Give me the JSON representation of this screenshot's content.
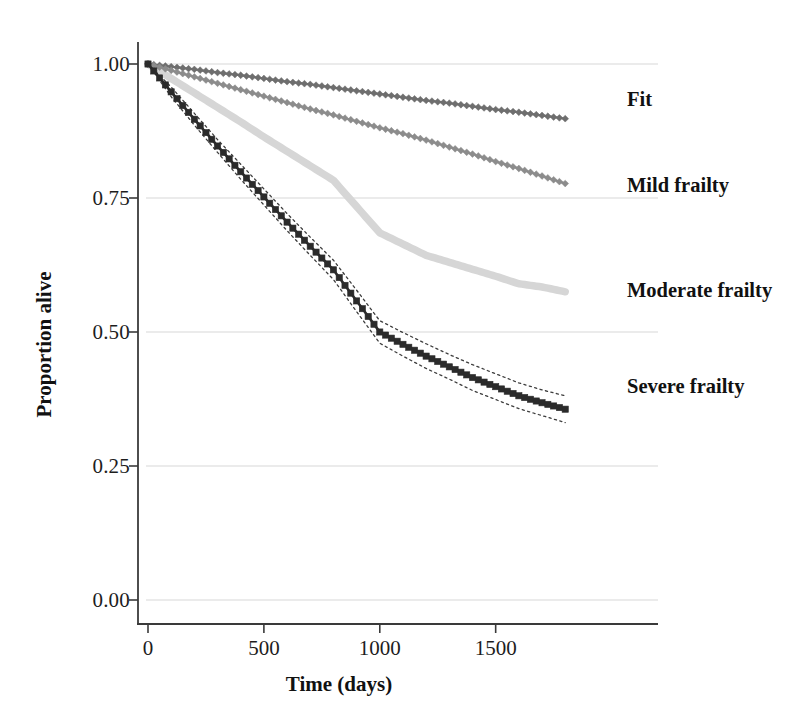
{
  "chart_data": {
    "type": "line",
    "title": "",
    "subtitle": "",
    "xlabel": "Time (days)",
    "ylabel": "Proportion alive",
    "xlim": [
      0,
      1825
    ],
    "ylim": [
      0.0,
      1.0
    ],
    "xticks": [
      0,
      500,
      1000,
      1500
    ],
    "xtick_labels": [
      "0",
      "500",
      "1000",
      "1500"
    ],
    "yticks": [
      0.0,
      0.25,
      0.5,
      0.75,
      1.0
    ],
    "ytick_labels": [
      "0.00",
      "0.25",
      "0.50",
      "0.75",
      "1.00"
    ],
    "grid": "horizontal",
    "legend_position": "right-inline",
    "x": [
      0,
      100,
      200,
      300,
      400,
      500,
      600,
      700,
      800,
      900,
      1000,
      1100,
      1200,
      1300,
      1400,
      1500,
      1600,
      1700,
      1800
    ],
    "series": [
      {
        "name": "Fit",
        "color": "#6e6e6e",
        "marker": "diamond",
        "label_y": 0.935,
        "values": [
          1.0,
          0.995,
          0.99,
          0.984,
          0.979,
          0.973,
          0.967,
          0.962,
          0.956,
          0.95,
          0.944,
          0.938,
          0.932,
          0.927,
          0.921,
          0.915,
          0.91,
          0.904,
          0.898
        ]
      },
      {
        "name": "Mild frailty",
        "color": "#8c8c8c",
        "marker": "diamond",
        "label_y": 0.775,
        "values": [
          1.0,
          0.988,
          0.976,
          0.964,
          0.952,
          0.94,
          0.928,
          0.916,
          0.905,
          0.893,
          0.881,
          0.87,
          0.858,
          0.845,
          0.832,
          0.818,
          0.805,
          0.791,
          0.777
        ]
      },
      {
        "name": "Moderate frailty",
        "color": "#d6d6d6",
        "marker": "none",
        "label_y": 0.578,
        "values": [
          1.0,
          0.973,
          0.946,
          0.919,
          0.892,
          0.864,
          0.837,
          0.81,
          0.783,
          0.734,
          0.685,
          0.664,
          0.643,
          0.63,
          0.617,
          0.604,
          0.59,
          0.584,
          0.575
        ]
      },
      {
        "name": "Severe frailty",
        "color": "#2b2b2b",
        "marker": "square",
        "label_y": 0.4,
        "confidence_band": true,
        "band_style": "dotted",
        "values": [
          1.0,
          0.948,
          0.897,
          0.847,
          0.799,
          0.752,
          0.705,
          0.66,
          0.616,
          0.558,
          0.5,
          0.477,
          0.455,
          0.435,
          0.415,
          0.398,
          0.381,
          0.368,
          0.356
        ],
        "upper": [
          1.0,
          0.957,
          0.908,
          0.859,
          0.813,
          0.767,
          0.721,
          0.677,
          0.634,
          0.578,
          0.521,
          0.499,
          0.478,
          0.458,
          0.439,
          0.422,
          0.405,
          0.392,
          0.381
        ],
        "lower": [
          1.0,
          0.939,
          0.886,
          0.835,
          0.785,
          0.737,
          0.689,
          0.643,
          0.598,
          0.538,
          0.479,
          0.455,
          0.432,
          0.412,
          0.391,
          0.374,
          0.357,
          0.344,
          0.331
        ]
      }
    ]
  },
  "axes": {
    "x_title": "Time (days)",
    "y_title": "Proportion alive"
  }
}
